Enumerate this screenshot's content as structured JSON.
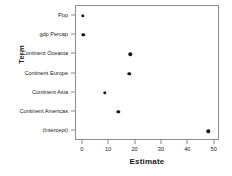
{
  "chart_data": {
    "type": "scatter",
    "title": "",
    "xlabel": "Estimate",
    "ylabel": "Term",
    "xlim": [
      -2.6,
      52.0
    ],
    "xticks": [
      0,
      10,
      20,
      30,
      40,
      50
    ],
    "xtick_labels": [
      "0",
      "10",
      "20",
      "30",
      "40",
      "50"
    ],
    "grid": false,
    "legend": null,
    "categories": [
      "Pop",
      "gdp Percap",
      "Continent Oceania",
      "Continent Europe",
      "Continent Asia",
      "Continent Americas",
      "(Intercept)"
    ],
    "values": [
      0.0,
      0.1,
      18.0,
      17.6,
      8.4,
      13.5,
      47.6
    ],
    "point_color": "#1a1a1a",
    "panel_border_color": "#8c8c8c",
    "background_color": "#ffffff"
  }
}
